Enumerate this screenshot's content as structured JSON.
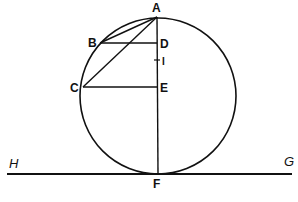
{
  "diagram": {
    "type": "geometric-construction",
    "colors": {
      "stroke": "#111111",
      "background": "#ffffff"
    },
    "circle": {
      "cx": 158,
      "cy": 96,
      "r": 78
    },
    "points": {
      "A": {
        "label": "A",
        "x": 157,
        "y": 17
      },
      "B": {
        "label": "B",
        "x": 100,
        "y": 43
      },
      "C": {
        "label": "C",
        "x": 83,
        "y": 87
      },
      "D": {
        "label": "D",
        "x": 157,
        "y": 43
      },
      "I": {
        "label": "I",
        "x": 157,
        "y": 60
      },
      "E": {
        "label": "E",
        "x": 157,
        "y": 87
      },
      "F": {
        "label": "F",
        "x": 157,
        "y": 174
      },
      "H": {
        "label": "H"
      },
      "G": {
        "label": "G"
      }
    },
    "segments": [
      "AB",
      "AC",
      "BD",
      "CE",
      "AF",
      "HG"
    ]
  }
}
